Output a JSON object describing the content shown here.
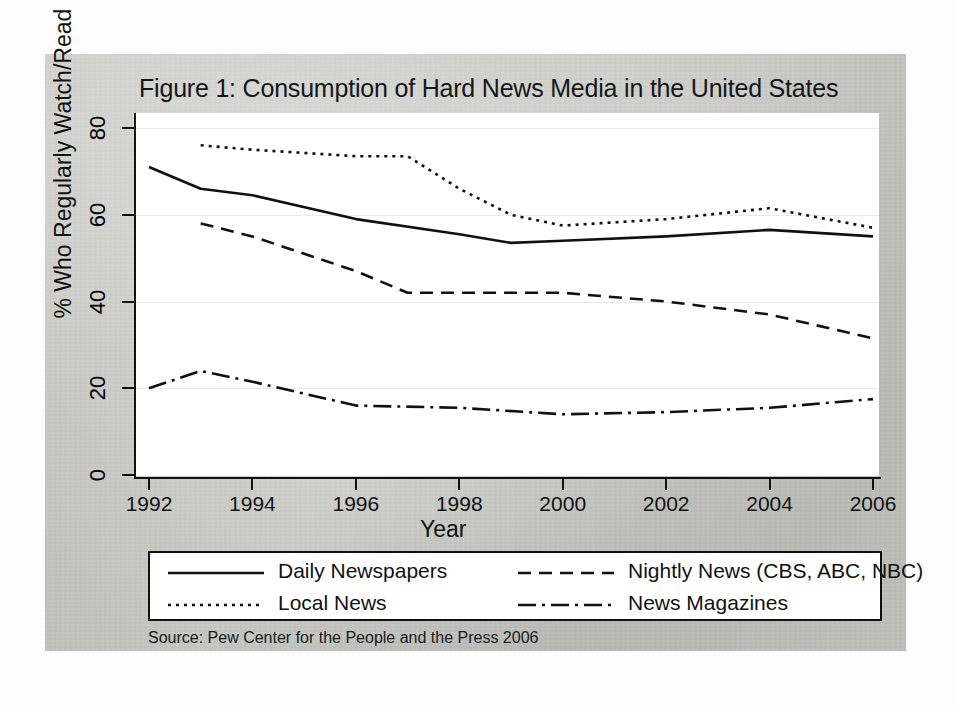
{
  "figure": {
    "title": "Figure 1: Consumption of Hard News Media in the United States",
    "source": "Source: Pew Center for the People and the Press 2006"
  },
  "chart_data": {
    "type": "line",
    "title": "Figure 1: Consumption of Hard News Media in the United States",
    "xlabel": "Year",
    "ylabel": "% Who Regularly Watch/Read",
    "xlim": [
      1991.5,
      2006.5
    ],
    "ylim": [
      0,
      84
    ],
    "xticks": [
      "1992",
      "1994",
      "1996",
      "1998",
      "2000",
      "2002",
      "2004",
      "2006"
    ],
    "xtick_values": [
      1992,
      1994,
      1996,
      1998,
      2000,
      2002,
      2004,
      2006
    ],
    "yticks": [
      "0",
      "20",
      "40",
      "60",
      "80"
    ],
    "ytick_values": [
      0,
      20,
      40,
      60,
      80
    ],
    "grid": true,
    "legend_position": "bottom",
    "series": [
      {
        "name": "Daily Newspapers",
        "style": "solid",
        "x": [
          1992,
          1993,
          1994,
          1996,
          1998,
          1999,
          2000,
          2002,
          2004,
          2006
        ],
        "values": [
          71,
          66,
          64.5,
          59,
          55.5,
          53.5,
          54,
          55,
          56.5,
          55
        ]
      },
      {
        "name": "Local News",
        "style": "dotted",
        "x": [
          1993,
          1994,
          1996,
          1997,
          1998,
          1999,
          2000,
          2002,
          2004,
          2006
        ],
        "values": [
          76,
          75,
          73.5,
          73.5,
          66,
          60,
          57.5,
          59,
          61.5,
          57
        ]
      },
      {
        "name": "Nightly News (CBS, ABC, NBC)",
        "style": "dashed",
        "x": [
          1993,
          1994,
          1996,
          1997,
          1998,
          2000,
          2002,
          2004,
          2006
        ],
        "values": [
          58,
          55,
          47,
          42,
          42,
          42,
          40,
          37,
          31.5
        ]
      },
      {
        "name": "News Magazines",
        "style": "dashdot",
        "x": [
          1992,
          1993,
          1994,
          1996,
          1998,
          2000,
          2002,
          2004,
          2006
        ],
        "values": [
          20,
          24,
          21.5,
          16,
          15.5,
          14,
          14.5,
          15.5,
          17.5
        ]
      }
    ]
  },
  "legend": {
    "items": [
      {
        "label": "Daily Newspapers",
        "style": "solid"
      },
      {
        "label": "Local News",
        "style": "dotted"
      },
      {
        "label": "Nightly News (CBS, ABC, NBC)",
        "style": "dashed"
      },
      {
        "label": "News Magazines",
        "style": "dashdot"
      }
    ]
  }
}
